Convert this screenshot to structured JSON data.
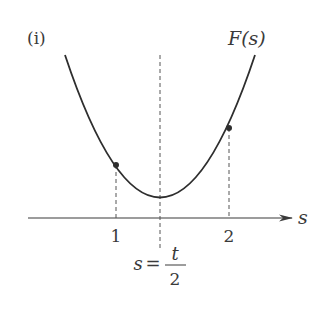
{
  "diagram": {
    "panel_label": "(i)",
    "function_label": "F(s)",
    "axis_label": "s",
    "ticks": [
      {
        "label": "1",
        "value": 1
      },
      {
        "label": "2",
        "value": 2
      }
    ],
    "vertex_label": {
      "lhs": "s",
      "eq": "=",
      "numerator": "t",
      "denominator": "2"
    },
    "colors": {
      "curve": "#2e2e2e",
      "axis": "#3a3a3a",
      "dashed": "#555555",
      "text": "#3a3a3a"
    }
  }
}
